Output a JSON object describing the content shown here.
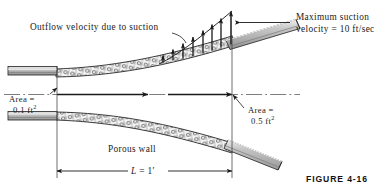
{
  "figure": {
    "number_label": "FIGURE 4-16",
    "colors": {
      "ink": "#1a1a1a",
      "pipe_fill": "#b8b8b8",
      "pipe_fill_light": "#d8d8d8",
      "porous_fill": "#eeeeee",
      "background": "#ffffff"
    }
  },
  "labels": {
    "outflow": "Outflow velocity due to suction",
    "max_suction_line1": "Maximum suction",
    "max_suction_line2": "velocity = 10 ft/sec",
    "area_inlet_line1": "Area =",
    "area_inlet_value": "0.1 ft",
    "area_inlet_exp": "2",
    "area_outlet_line1": "Area =",
    "area_outlet_value": "0.5 ft",
    "area_outlet_exp": "2",
    "porous_wall": "Porous wall",
    "length_symbol": "L",
    "length_equals": " = 1",
    "length_prime": "′"
  },
  "diagram_data": {
    "type": "engineering-schematic",
    "description": "Diverging duct with porous walls and suction; inlet pipe at left, outlet pipe at right",
    "inlet_area_ft2": 0.1,
    "outlet_area_ft2": 0.5,
    "length_ft": 1,
    "max_suction_velocity_ft_per_sec": 10,
    "suction_profile_arrow_heights": [
      6,
      10,
      14,
      19,
      24,
      29,
      34,
      40
    ],
    "flow_arrow_count": 2,
    "centerline_style": "dash-dot"
  }
}
